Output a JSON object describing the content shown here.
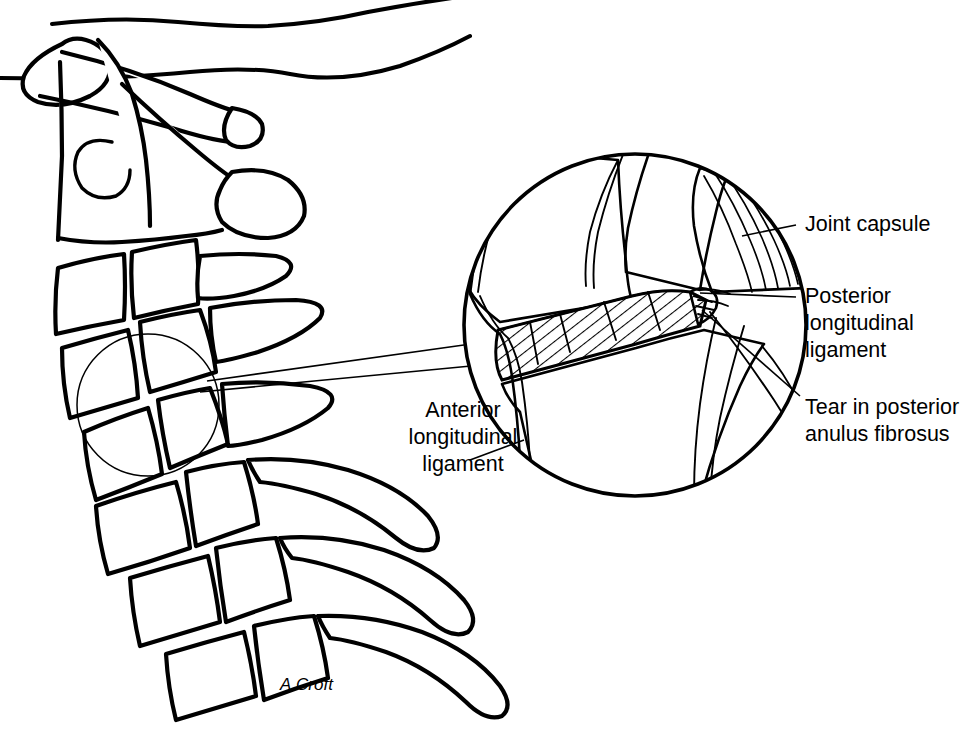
{
  "figure": {
    "signature": "A.Croft",
    "background_color": "#ffffff",
    "ink_color": "#000000"
  },
  "labels": {
    "joint_capsule": {
      "lines": [
        "Joint capsule"
      ],
      "anchor_x": 805,
      "anchor_y": 225
    },
    "posterior_longitudinal_ligament": {
      "lines": [
        "Posterior",
        "longitudinal",
        "ligament"
      ],
      "anchor_x": 805,
      "anchor_y": 297
    },
    "tear_posterior_anulus": {
      "lines": [
        "Tear in posterior",
        "anulus fibrosus"
      ],
      "anchor_x": 805,
      "anchor_y": 408
    },
    "anterior_longitudinal_ligament": {
      "lines": [
        "Anterior",
        "longitudinal",
        "ligament"
      ],
      "anchor_x": 463,
      "anchor_y": 411
    }
  },
  "detail_circle": {
    "center_x": 635,
    "center_y": 325,
    "radius": 172,
    "name": "magnified-joint-detail"
  },
  "locator_circle": {
    "center_x": 148,
    "center_y": 405,
    "radius": 71,
    "name": "spine-region-locator"
  },
  "connectors": [
    {
      "name": "locator-to-detail-upper",
      "x1": 207,
      "y1": 381,
      "x2": 471,
      "y2": 344
    },
    {
      "name": "locator-to-detail-lower",
      "x1": 200,
      "y1": 392,
      "x2": 471,
      "y2": 366
    }
  ],
  "anatomy": {
    "region": "cervical spine",
    "view": "lateral",
    "vertebrae_count": 7,
    "structures": [
      "skull base",
      "atlas",
      "axis",
      "vertebral bodies",
      "spinous processes",
      "intervertebral disc",
      "facet joint"
    ]
  }
}
